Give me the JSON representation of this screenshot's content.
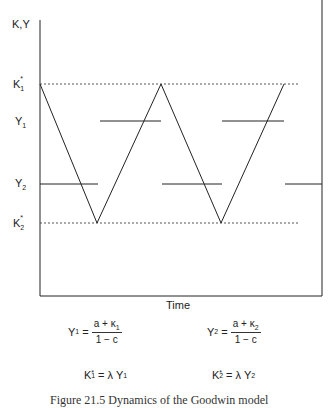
{
  "diagram": {
    "y_axis_label": "K,Y",
    "x_axis_label": "Time",
    "levels": {
      "K1_star": {
        "label": "K",
        "sub": "1",
        "sup": "*"
      },
      "Y1": {
        "label": "Y",
        "sub": "1"
      },
      "Y2": {
        "label": "Y",
        "sub": "2"
      },
      "K2_star": {
        "label": "K",
        "sub": "2",
        "sup": "*"
      }
    },
    "cycle_description": "Capital oscillates linearly between K1* and K2*; output jumps between Y1 and Y2",
    "zigzag_points": [
      "K1*",
      "K2*",
      "K1*",
      "K2*",
      "K1*"
    ]
  },
  "equations": {
    "y1": {
      "lhs": "Y",
      "lhs_sub": "1",
      "num_a": "a + κ",
      "num_sub": "1",
      "den": "1 − c"
    },
    "y2": {
      "lhs": "Y",
      "lhs_sub": "2",
      "num_a": "a + κ",
      "num_sub": "2",
      "den": "1 − c"
    },
    "k1": {
      "lhs": "K",
      "lhs_sub": "1",
      "lhs_sup": "*",
      "rhs": "= λ Y",
      "rhs_sub": "1"
    },
    "k2": {
      "lhs": "K",
      "lhs_sub": "2",
      "lhs_sup": "*",
      "rhs": "= λ Y",
      "rhs_sub": "2"
    }
  },
  "caption": "Figure 21.5 Dynamics of the Goodwin model",
  "colors": {
    "ink": "#222222",
    "dotted": "#555555"
  }
}
